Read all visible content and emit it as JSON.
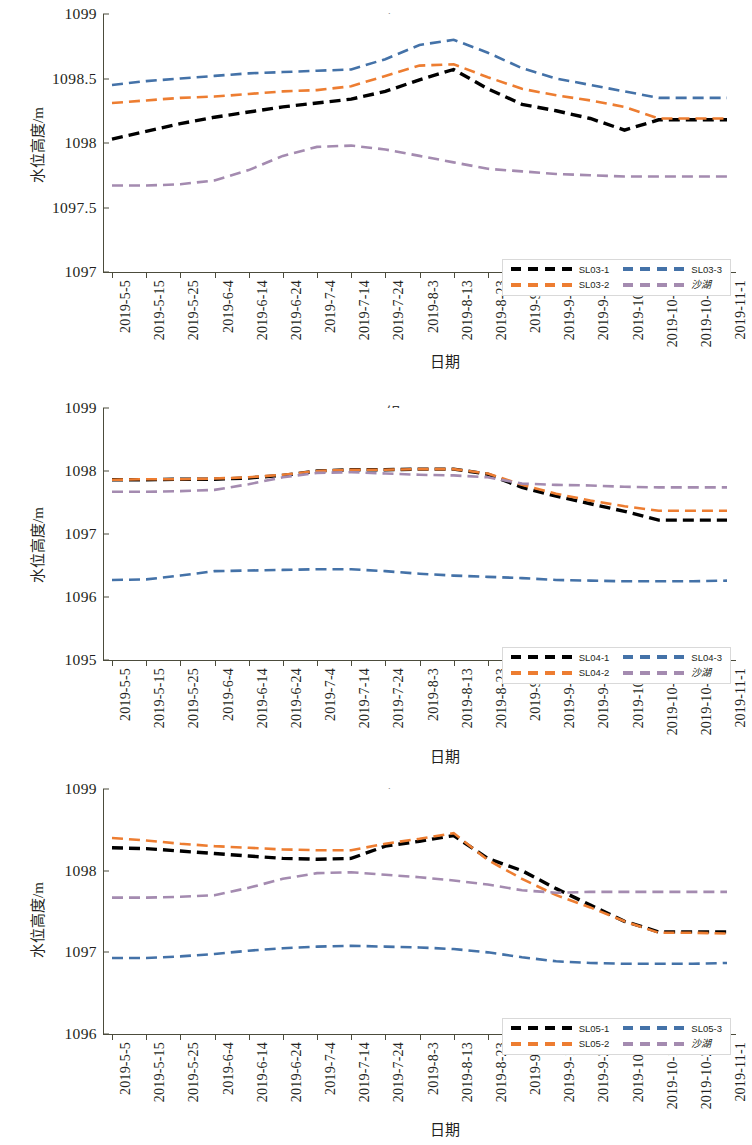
{
  "page": {
    "width": 752,
    "height": 1145,
    "background": "#ffffff"
  },
  "axis": {
    "y_title": "水位高度/m",
    "x_title": "日期"
  },
  "colors": {
    "series_1": "#000000",
    "series_2": "#ED7D31",
    "series_3": "#4472A8",
    "lake": "#A48BB0",
    "axis": "#4c4c3c",
    "text": "#231f20",
    "legend_border": "#d9d9d9"
  },
  "categories": [
    "2019-5-5",
    "2019-5-15",
    "2019-5-25",
    "2019-6-4",
    "2019-6-14",
    "2019-6-24",
    "2019-7-4",
    "2019-7-14",
    "2019-7-24",
    "2019-8-3",
    "2019-8-13",
    "2019-8-23",
    "2019-9-2",
    "2019-9-12",
    "2019-9-22",
    "2019-10-2",
    "2019-10-12",
    "2019-10-22",
    "2019-11-1"
  ],
  "chart_data": [
    {
      "type": "line",
      "title": "SL03组",
      "xlabel": "日期",
      "ylabel": "水位高度/m",
      "ylim": [
        1097,
        1099
      ],
      "yticks": [
        "1097",
        "1097.5",
        "1098",
        "1098.5",
        "1099"
      ],
      "ytick_values": [
        1097,
        1097.5,
        1098,
        1098.5,
        1099
      ],
      "grid": false,
      "legend_position": "bottom-right",
      "categories": [
        "2019-5-5",
        "2019-5-15",
        "2019-5-25",
        "2019-6-4",
        "2019-6-14",
        "2019-6-24",
        "2019-7-4",
        "2019-7-14",
        "2019-7-24",
        "2019-8-3",
        "2019-8-13",
        "2019-8-23",
        "2019-9-2",
        "2019-9-12",
        "2019-9-22",
        "2019-10-2",
        "2019-10-12",
        "2019-10-22",
        "2019-11-1"
      ],
      "series": [
        {
          "name": "SL03-1",
          "color": "#000000",
          "values": [
            1098.03,
            1098.09,
            1098.15,
            1098.2,
            1098.24,
            1098.28,
            1098.31,
            1098.34,
            1098.4,
            1098.49,
            1098.57,
            1098.42,
            1098.3,
            1098.25,
            1098.19,
            1098.1,
            1098.18,
            1098.18,
            1098.18
          ]
        },
        {
          "name": "SL03-2",
          "color": "#ED7D31",
          "values": [
            1098.31,
            1098.33,
            1098.35,
            1098.36,
            1098.38,
            1098.4,
            1098.41,
            1098.44,
            1098.52,
            1098.6,
            1098.61,
            1098.51,
            1098.42,
            1098.37,
            1098.33,
            1098.28,
            1098.19,
            1098.19,
            1098.19
          ]
        },
        {
          "name": "SL03-3",
          "color": "#4472A8",
          "values": [
            1098.45,
            1098.48,
            1098.5,
            1098.52,
            1098.54,
            1098.55,
            1098.56,
            1098.57,
            1098.65,
            1098.76,
            1098.8,
            1098.7,
            1098.58,
            1098.5,
            1098.45,
            1098.4,
            1098.35,
            1098.35,
            1098.35
          ]
        },
        {
          "name": "沙湖",
          "color": "#A48BB0",
          "values": [
            1097.67,
            1097.67,
            1097.68,
            1097.71,
            1097.79,
            1097.9,
            1097.97,
            1097.98,
            1097.95,
            1097.9,
            1097.85,
            1097.8,
            1097.78,
            1097.76,
            1097.75,
            1097.74,
            1097.74,
            1097.74,
            1097.74
          ]
        }
      ]
    },
    {
      "type": "line",
      "title": "SL04组",
      "xlabel": "日期",
      "ylabel": "水位高度/m",
      "ylim": [
        1095,
        1099
      ],
      "yticks": [
        "1095",
        "1096",
        "1097",
        "1098",
        "1099"
      ],
      "ytick_values": [
        1095,
        1096,
        1097,
        1098,
        1099
      ],
      "grid": false,
      "legend_position": "bottom-right",
      "categories": [
        "2019-5-5",
        "2019-5-15",
        "2019-5-25",
        "2019-6-4",
        "2019-6-14",
        "2019-6-24",
        "2019-7-4",
        "2019-7-14",
        "2019-7-24",
        "2019-8-3",
        "2019-8-13",
        "2019-8-23",
        "2019-9-2",
        "2019-9-12",
        "2019-9-22",
        "2019-10-2",
        "2019-10-12",
        "2019-10-22",
        "2019-11-1"
      ],
      "series": [
        {
          "name": "SL04-1",
          "color": "#000000",
          "values": [
            1097.86,
            1097.86,
            1097.87,
            1097.87,
            1097.89,
            1097.93,
            1098.0,
            1098.02,
            1098.02,
            1098.03,
            1098.03,
            1097.95,
            1097.74,
            1097.6,
            1097.48,
            1097.36,
            1097.22,
            1097.22,
            1097.22
          ]
        },
        {
          "name": "SL04-2",
          "color": "#ED7D31",
          "values": [
            1097.86,
            1097.87,
            1097.87,
            1097.88,
            1097.9,
            1097.94,
            1098.0,
            1098.02,
            1098.02,
            1098.03,
            1098.03,
            1097.96,
            1097.78,
            1097.64,
            1097.53,
            1097.44,
            1097.37,
            1097.37,
            1097.37
          ]
        },
        {
          "name": "SL04-3",
          "color": "#4472A8",
          "values": [
            1096.27,
            1096.28,
            1096.34,
            1096.41,
            1096.42,
            1096.43,
            1096.44,
            1096.44,
            1096.41,
            1096.37,
            1096.34,
            1096.32,
            1096.3,
            1096.27,
            1096.26,
            1096.25,
            1096.25,
            1096.25,
            1096.26
          ]
        },
        {
          "name": "沙湖",
          "color": "#A48BB0",
          "values": [
            1097.67,
            1097.67,
            1097.68,
            1097.7,
            1097.79,
            1097.9,
            1097.97,
            1097.98,
            1097.96,
            1097.94,
            1097.93,
            1097.9,
            1097.8,
            1097.78,
            1097.77,
            1097.75,
            1097.74,
            1097.74,
            1097.74
          ]
        }
      ]
    },
    {
      "type": "line",
      "title": "SL05组",
      "xlabel": "日期",
      "ylabel": "水位高度/m",
      "ylim": [
        1096,
        1099
      ],
      "yticks": [
        "1096",
        "1097",
        "1098",
        "1099"
      ],
      "ytick_values": [
        1096,
        1097,
        1098,
        1099
      ],
      "grid": false,
      "legend_position": "bottom-right",
      "categories": [
        "2019-5-5",
        "2019-5-15",
        "2019-5-25",
        "2019-6-4",
        "2019-6-14",
        "2019-6-24",
        "2019-7-4",
        "2019-7-14",
        "2019-7-24",
        "2019-8-3",
        "2019-8-13",
        "2019-8-23",
        "2019-9-2",
        "2019-9-12",
        "2019-9-22",
        "2019-10-2",
        "2019-10-12",
        "2019-10-22",
        "2019-11-1"
      ],
      "series": [
        {
          "name": "SL05-1",
          "color": "#000000",
          "values": [
            1098.28,
            1098.27,
            1098.24,
            1098.21,
            1098.18,
            1098.15,
            1098.14,
            1098.15,
            1098.3,
            1098.36,
            1098.43,
            1098.15,
            1098.0,
            1097.78,
            1097.58,
            1097.38,
            1097.25,
            1097.25,
            1097.25
          ]
        },
        {
          "name": "SL05-2",
          "color": "#ED7D31",
          "values": [
            1098.4,
            1098.37,
            1098.33,
            1098.3,
            1098.28,
            1098.26,
            1098.25,
            1098.25,
            1098.33,
            1098.39,
            1098.46,
            1098.13,
            1097.9,
            1097.7,
            1097.55,
            1097.38,
            1097.24,
            1097.24,
            1097.23
          ]
        },
        {
          "name": "SL05-3",
          "color": "#4472A8",
          "values": [
            1096.93,
            1096.93,
            1096.95,
            1096.98,
            1097.02,
            1097.05,
            1097.07,
            1097.08,
            1097.07,
            1097.06,
            1097.04,
            1097.0,
            1096.94,
            1096.89,
            1096.87,
            1096.86,
            1096.86,
            1096.86,
            1096.87
          ]
        },
        {
          "name": "沙湖",
          "color": "#A48BB0",
          "values": [
            1097.67,
            1097.67,
            1097.68,
            1097.7,
            1097.79,
            1097.9,
            1097.97,
            1097.98,
            1097.95,
            1097.92,
            1097.88,
            1097.83,
            1097.76,
            1097.73,
            1097.74,
            1097.74,
            1097.74,
            1097.74,
            1097.74
          ]
        }
      ]
    }
  ]
}
